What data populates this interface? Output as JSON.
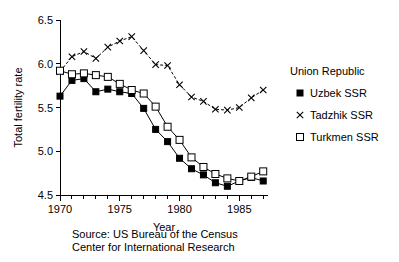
{
  "chart_data": {
    "type": "line",
    "title": "",
    "xlabel": "Year",
    "ylabel": "Total fertility rate",
    "xlim": [
      1970,
      1987.4
    ],
    "ylim": [
      4.5,
      6.5
    ],
    "yticks": [
      "4.5",
      "5.0",
      "5.5",
      "6.0",
      "6.5"
    ],
    "ytick_values": [
      4.5,
      5.0,
      5.5,
      6.0,
      6.5
    ],
    "xticks": [
      "1970",
      "1975",
      "1980",
      "1985"
    ],
    "xtick_values": [
      1970,
      1975,
      1980,
      1985
    ],
    "minor_x_step": 1,
    "grid": false,
    "legend_position": "right",
    "legend_title": "Union Republic",
    "x": [
      1970,
      1971,
      1972,
      1973,
      1974,
      1975,
      1976,
      1977,
      1978,
      1979,
      1980,
      1981,
      1982,
      1983,
      1984,
      1985,
      1986,
      1987
    ],
    "series": [
      {
        "name": "Uzbek SSR",
        "marker": "filled-square",
        "values": [
          5.63,
          5.81,
          5.83,
          5.68,
          5.71,
          5.68,
          5.66,
          5.49,
          5.25,
          5.11,
          4.92,
          4.8,
          4.73,
          4.64,
          4.6,
          4.66,
          4.7,
          4.66
        ]
      },
      {
        "name": "Tadzhik SSR",
        "marker": "cross",
        "values": [
          5.91,
          6.08,
          6.14,
          6.06,
          6.19,
          6.26,
          6.31,
          6.15,
          5.99,
          5.98,
          5.76,
          5.62,
          5.57,
          5.48,
          5.47,
          5.5,
          5.61,
          5.7
        ]
      },
      {
        "name": "Turkmen SSR",
        "marker": "open-square",
        "values": [
          5.92,
          5.88,
          5.89,
          5.87,
          5.85,
          5.77,
          5.7,
          5.66,
          5.51,
          5.28,
          5.13,
          4.93,
          4.82,
          4.74,
          4.69,
          4.66,
          4.71,
          4.77
        ]
      }
    ]
  },
  "legend": {
    "title": "Union Republic",
    "entries": [
      {
        "label": "Uzbek SSR",
        "marker": "filled-square"
      },
      {
        "label": "Tadzhik SSR",
        "marker": "cross"
      },
      {
        "label": "Turkmen SSR",
        "marker": "open-square"
      }
    ]
  },
  "axes": {
    "x_title": "Year",
    "y_title": "Total fertility rate",
    "x_tick_labels": [
      "1970",
      "1975",
      "1980",
      "1985"
    ],
    "y_tick_labels": [
      "6.5",
      "6.0",
      "5.5",
      "5.0",
      "4.5"
    ]
  },
  "source": {
    "line1": "Source: US Bureau of the Census",
    "line2": "Center for International Research"
  }
}
